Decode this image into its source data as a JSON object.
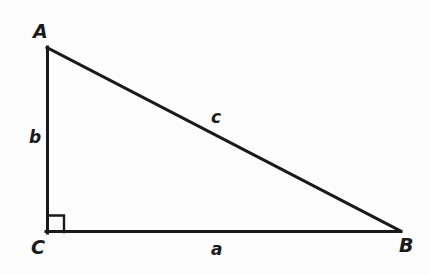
{
  "figure": {
    "type": "right-triangle-diagram",
    "background_color": "#fdfdfd",
    "stroke_color": "#1a1a1a",
    "stroke_width": 3,
    "vertices": [
      {
        "name": "A",
        "label": "A",
        "x": 47,
        "y": 47,
        "label_x": 33,
        "label_y": 22
      },
      {
        "name": "B",
        "label": "B",
        "x": 400,
        "y": 232,
        "label_x": 399,
        "label_y": 236
      },
      {
        "name": "C",
        "label": "C",
        "x": 47,
        "y": 232,
        "label_x": 31,
        "label_y": 238
      }
    ],
    "sides": [
      {
        "name": "side-a",
        "label": "a",
        "from": "C",
        "to": "B",
        "label_x": 211,
        "label_y": 241
      },
      {
        "name": "side-b",
        "label": "b",
        "from": "A",
        "to": "C",
        "label_x": 29,
        "label_y": 129
      },
      {
        "name": "side-c",
        "label": "c",
        "from": "A",
        "to": "B",
        "label_x": 211,
        "label_y": 109
      }
    ],
    "right_angle": {
      "at_vertex": "C",
      "marker": "square",
      "size": 17,
      "x": 47,
      "y": 215
    }
  }
}
